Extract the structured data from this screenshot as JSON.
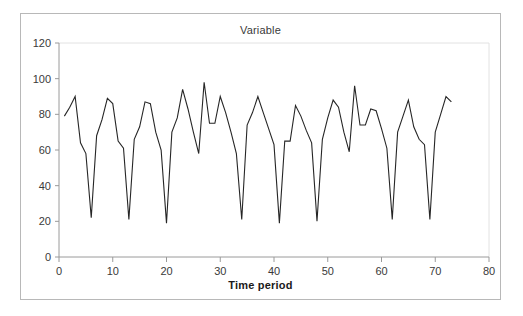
{
  "figure": {
    "title": "Variable",
    "x_axis_title": "Time period",
    "line_color": "#262626",
    "axis_color": "#9a9a9a",
    "border_color": "#b8b8b8",
    "background": "#ffffff"
  },
  "chart_data": {
    "type": "line",
    "title": "Variable",
    "xlabel": "Time period",
    "ylabel": "",
    "xlim": [
      0,
      80
    ],
    "ylim": [
      0,
      120
    ],
    "xticks": [
      0,
      10,
      20,
      30,
      40,
      50,
      60,
      70,
      80
    ],
    "yticks": [
      0,
      20,
      40,
      60,
      80,
      100,
      120
    ],
    "xtick_labels": [
      "0",
      "10",
      "20",
      "30",
      "40",
      "50",
      "60",
      "70",
      "80"
    ],
    "ytick_labels": [
      "0",
      "20",
      "40",
      "60",
      "80",
      "100",
      "120"
    ],
    "grid": false,
    "legend": false,
    "series": [
      {
        "name": "Variable",
        "x": [
          1,
          2,
          3,
          4,
          5,
          6,
          7,
          8,
          9,
          10,
          11,
          12,
          13,
          14,
          15,
          16,
          17,
          18,
          19,
          20,
          21,
          22,
          23,
          24,
          25,
          26,
          27,
          28,
          29,
          30,
          31,
          32,
          33,
          34,
          35,
          36,
          37,
          38,
          39,
          40,
          41,
          42,
          43,
          44,
          45,
          46,
          47,
          48,
          49,
          50,
          51,
          52,
          53,
          54,
          55,
          56,
          57,
          58,
          59,
          60,
          61,
          62,
          63,
          64,
          65,
          66,
          67,
          68,
          69,
          70,
          71,
          72,
          73
        ],
        "values": [
          79,
          84,
          90,
          64,
          58,
          22,
          68,
          77,
          89,
          86,
          65,
          61,
          21,
          66,
          73,
          87,
          86,
          70,
          60,
          19,
          70,
          78,
          94,
          83,
          70,
          58,
          98,
          75,
          75,
          90,
          81,
          70,
          58,
          21,
          74,
          81,
          90,
          81,
          72,
          63,
          19,
          65,
          65,
          85,
          79,
          71,
          64,
          20,
          66,
          78,
          88,
          84,
          70,
          59,
          96,
          74,
          74,
          83,
          82,
          72,
          61,
          21,
          70,
          79,
          88,
          73,
          66,
          63,
          21,
          70,
          80,
          90,
          87
        ]
      }
    ]
  }
}
